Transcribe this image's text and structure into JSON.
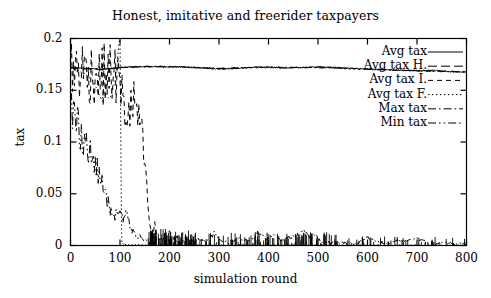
{
  "chart_data": {
    "type": "line",
    "title": "Honest, imitative and freerider taxpayers",
    "xlabel": "simulation round",
    "ylabel": "tax",
    "xlim": [
      0,
      800
    ],
    "ylim": [
      0,
      0.2
    ],
    "grid": false,
    "legend_position": "top-right-inside",
    "xticks": [
      0,
      100,
      200,
      300,
      400,
      500,
      600,
      700,
      800
    ],
    "xtick_labels": [
      "0",
      "100",
      "200",
      "300",
      "400",
      "500",
      "600",
      "700",
      "800"
    ],
    "yticks": [
      0,
      0.05,
      0.1,
      0.15,
      0.2
    ],
    "ytick_labels": [
      "0",
      "0.05",
      "0.1",
      "0.15",
      "0.2"
    ],
    "line_color": "#000000",
    "background_color": "#ffffff",
    "series": [
      {
        "name": "Avg tax",
        "dash": "solid",
        "x": [
          0,
          8,
          16,
          24,
          32,
          40,
          48,
          56,
          64,
          72,
          80,
          88,
          96,
          104,
          112,
          120,
          130,
          140,
          150,
          160,
          175,
          190,
          205,
          220,
          235,
          250,
          265,
          280,
          295,
          310,
          325,
          340,
          355,
          370,
          385,
          400,
          415,
          430,
          445,
          460,
          475,
          490,
          505,
          520,
          535,
          550,
          565,
          580,
          595,
          610,
          625,
          640,
          655,
          670,
          685,
          700,
          715,
          730,
          745,
          760,
          775,
          790,
          800
        ],
        "values": [
          0.1715,
          0.1718,
          0.1712,
          0.1716,
          0.1709,
          0.1714,
          0.1707,
          0.1705,
          0.1698,
          0.1702,
          0.1708,
          0.1711,
          0.1714,
          0.1719,
          0.1722,
          0.1724,
          0.1726,
          0.1727,
          0.1728,
          0.1729,
          0.1728,
          0.1726,
          0.1725,
          0.1727,
          0.1724,
          0.1719,
          0.1714,
          0.171,
          0.1707,
          0.1705,
          0.1709,
          0.1714,
          0.1718,
          0.1722,
          0.1725,
          0.1722,
          0.1718,
          0.1714,
          0.1716,
          0.1719,
          0.1722,
          0.1725,
          0.1726,
          0.1724,
          0.172,
          0.1716,
          0.1712,
          0.1708,
          0.1705,
          0.1702,
          0.1699,
          0.1697,
          0.1695,
          0.1693,
          0.1691,
          0.1689,
          0.169,
          0.1692,
          0.1688,
          0.1684,
          0.168,
          0.1677,
          0.1676
        ]
      },
      {
        "name": "Avg tax H.",
        "dash": "dashed-long",
        "x": [
          0,
          6,
          12,
          18,
          24,
          30,
          36,
          42,
          48,
          54,
          60,
          66,
          72,
          78,
          84,
          90,
          96,
          102,
          108,
          114,
          120,
          135,
          150,
          175,
          200,
          250,
          300,
          350,
          400,
          450,
          500,
          550,
          600,
          650,
          700,
          750,
          800
        ],
        "values": [
          0.1716,
          0.1714,
          0.1712,
          0.171,
          0.1709,
          0.1707,
          0.1706,
          0.1705,
          0.1704,
          0.1703,
          0.1703,
          0.1704,
          0.1706,
          0.1708,
          0.1711,
          0.1714,
          0.1716,
          0.1719,
          0.1722,
          0.1724,
          0.1726,
          0.1728,
          0.1729,
          0.1728,
          0.1727,
          0.1722,
          0.171,
          0.1718,
          0.1724,
          0.1717,
          0.1723,
          0.1714,
          0.1704,
          0.1696,
          0.169,
          0.1683,
          0.1677
        ]
      },
      {
        "name": "Avg tax I.",
        "dash": "dashed-medium",
        "x": [
          0,
          8,
          16,
          24,
          32,
          40,
          48,
          56,
          62,
          68,
          74,
          80,
          86,
          92,
          98,
          102,
          106,
          110,
          114,
          118,
          122,
          126,
          130,
          134,
          138,
          142,
          146,
          150,
          154,
          158,
          162,
          166,
          170,
          176,
          182,
          190,
          200,
          210,
          220,
          230,
          240
        ],
        "values": [
          0.1714,
          0.1706,
          0.1698,
          0.169,
          0.1678,
          0.1668,
          0.1658,
          0.164,
          0.163,
          0.1648,
          0.166,
          0.1652,
          0.1668,
          0.164,
          0.1552,
          0.1478,
          0.1388,
          0.131,
          0.1248,
          0.129,
          0.134,
          0.1366,
          0.1352,
          0.13,
          0.124,
          0.1128,
          0.096,
          0.076,
          0.054,
          0.03,
          0.014,
          0.009,
          0.021,
          0.0075,
          0.006,
          0.005,
          0.0142,
          0.004,
          0.0035,
          0.003,
          0.0028
        ]
      },
      {
        "name": "Avg tax F.",
        "dash": "dotted",
        "x": [
          0,
          8,
          16,
          24,
          32,
          40,
          46,
          52,
          58,
          62,
          66,
          70,
          74,
          78,
          82,
          86,
          90,
          94,
          97,
          99,
          100,
          101,
          102,
          103,
          104,
          110,
          120,
          140,
          160,
          200,
          300,
          400,
          500,
          600,
          700,
          800
        ],
        "values": [
          0.1716,
          0.17,
          0.1688,
          0.1672,
          0.165,
          0.1616,
          0.158,
          0.152,
          0.1458,
          0.1418,
          0.144,
          0.1484,
          0.146,
          0.1418,
          0.1442,
          0.152,
          0.16,
          0.174,
          0.192,
          0.199,
          0.2,
          0.15,
          0.08,
          0.02,
          0.002,
          0.001,
          0.0008,
          0.0006,
          0.0005,
          0.0004,
          0.0003,
          0.0003,
          0.0002,
          0.0002,
          0.0002,
          0.0002
        ]
      },
      {
        "name": "Max tax",
        "dash": "dash-dot",
        "x": [
          0,
          20,
          40,
          60,
          80,
          100,
          120,
          140,
          160,
          180,
          200,
          300,
          400,
          500,
          600,
          700,
          800
        ],
        "values": [
          0.1716,
          0.1712,
          0.1708,
          0.1706,
          0.1712,
          0.172,
          0.1724,
          0.1727,
          0.1729,
          0.1729,
          0.1728,
          0.1712,
          0.1722,
          0.1718,
          0.1702,
          0.1689,
          0.1677
        ]
      },
      {
        "name": "Min tax",
        "dash": "dash-dot-dot",
        "x": [
          0,
          4,
          8,
          12,
          16,
          20,
          24,
          28,
          32,
          36,
          40,
          44,
          48,
          52,
          56,
          60,
          64,
          68,
          72,
          76,
          80,
          84,
          88,
          92,
          96,
          100,
          104,
          108,
          112,
          116,
          120,
          124,
          128,
          132,
          136,
          140,
          144,
          148,
          152,
          156,
          160,
          170,
          180,
          190,
          200,
          215,
          230,
          245,
          260,
          275,
          290,
          305,
          320,
          340,
          360,
          380,
          395,
          410,
          425,
          440,
          455,
          470,
          485,
          495,
          505,
          520,
          540,
          560,
          580,
          600,
          610,
          625,
          645,
          660,
          680,
          700,
          715,
          730,
          745,
          760,
          775,
          790,
          800
        ],
        "values": [
          0.1348,
          0.129,
          0.1252,
          0.1196,
          0.1168,
          0.1122,
          0.1082,
          0.1038,
          0.0986,
          0.093,
          0.0884,
          0.084,
          0.0796,
          0.0744,
          0.0706,
          0.0658,
          0.06,
          0.054,
          0.047,
          0.04,
          0.0332,
          0.03,
          0.028,
          0.031,
          0.0268,
          0.033,
          0.029,
          0.0248,
          0.031,
          0.0268,
          0.018,
          0.0135,
          0.015,
          0.0095,
          0.006,
          0.011,
          0.007,
          0.004,
          0.0055,
          0.003,
          0.0025,
          0.01,
          0.006,
          0.008,
          0.0045,
          0.009,
          0.0055,
          0.0035,
          0.0062,
          0.003,
          0.012,
          0.0038,
          0.0028,
          0.007,
          0.0045,
          0.013,
          0.006,
          0.01,
          0.005,
          0.0075,
          0.009,
          0.014,
          0.0065,
          0.011,
          0.004,
          0.003,
          0.002,
          0.0025,
          0.0018,
          0.009,
          0.0055,
          0.003,
          0.002,
          0.0048,
          0.0042,
          0.007,
          0.0038,
          0.0022,
          0.0018,
          0.003,
          0.0025,
          0.002,
          0.0018
        ]
      }
    ]
  }
}
